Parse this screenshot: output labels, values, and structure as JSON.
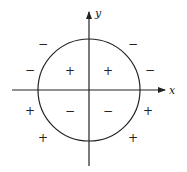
{
  "diagram": {
    "type": "sign-regions-plot",
    "axes": {
      "origin": [
        89,
        90
      ],
      "x": {
        "label": "x",
        "from": 12,
        "to": 165
      },
      "y": {
        "label": "y",
        "from": 166,
        "to": 12
      }
    },
    "circle": {
      "cx": 89,
      "cy": 90,
      "r": 51
    },
    "colors": {
      "stroke": "#222222",
      "background": "#ffffff"
    },
    "signs": [
      {
        "symbol": "−",
        "x": 43,
        "y": 48,
        "region": "outside-upper-left"
      },
      {
        "symbol": "−",
        "x": 133,
        "y": 48,
        "region": "outside-upper-right"
      },
      {
        "symbol": "−",
        "x": 30,
        "y": 74,
        "region": "outside-left-above-axis"
      },
      {
        "symbol": "−",
        "x": 150,
        "y": 74,
        "region": "outside-right-above-axis"
      },
      {
        "symbol": "+",
        "x": 70,
        "y": 75,
        "region": "inside-upper-left"
      },
      {
        "symbol": "+",
        "x": 108,
        "y": 75,
        "region": "inside-upper-right"
      },
      {
        "symbol": "−",
        "x": 70,
        "y": 115,
        "region": "inside-lower-left"
      },
      {
        "symbol": "−",
        "x": 108,
        "y": 115,
        "region": "inside-lower-right"
      },
      {
        "symbol": "+",
        "x": 30,
        "y": 115,
        "region": "outside-left-below-axis"
      },
      {
        "symbol": "+",
        "x": 148,
        "y": 115,
        "region": "outside-right-below-axis"
      },
      {
        "symbol": "+",
        "x": 43,
        "y": 142,
        "region": "outside-lower-left"
      },
      {
        "symbol": "+",
        "x": 133,
        "y": 142,
        "region": "outside-lower-right"
      }
    ]
  }
}
